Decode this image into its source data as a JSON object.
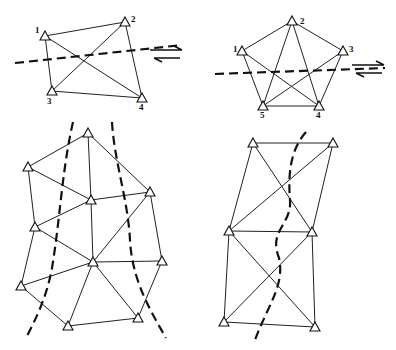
{
  "diagrams": [
    {
      "id": "quadrilateral",
      "stations": [
        {
          "label": "1",
          "x": 45,
          "y": 36,
          "lx": 35,
          "ly": 33
        },
        {
          "label": "2",
          "x": 125,
          "y": 22,
          "lx": 131,
          "ly": 22
        },
        {
          "label": "3",
          "x": 52,
          "y": 91,
          "lx": 47,
          "ly": 104
        },
        {
          "label": "4",
          "x": 142,
          "y": 98,
          "lx": 139,
          "ly": 110
        }
      ],
      "edges": [
        [
          0,
          1
        ],
        [
          0,
          2
        ],
        [
          0,
          3
        ],
        [
          1,
          2
        ],
        [
          1,
          3
        ],
        [
          2,
          3
        ]
      ],
      "fault": "M15 63 L182 45",
      "shear_sense": "right-lateral",
      "arrow_origin": {
        "x": 150,
        "y": 46
      }
    },
    {
      "id": "pentagon",
      "stations": [
        {
          "label": "1",
          "x": 242,
          "y": 51,
          "lx": 233,
          "ly": 52
        },
        {
          "label": "2",
          "x": 292,
          "y": 21,
          "lx": 300,
          "ly": 24
        },
        {
          "label": "3",
          "x": 343,
          "y": 51,
          "lx": 349,
          "ly": 52
        },
        {
          "label": "4",
          "x": 319,
          "y": 106,
          "lx": 316,
          "ly": 118
        },
        {
          "label": "5",
          "x": 263,
          "y": 106,
          "lx": 260,
          "ly": 118
        }
      ],
      "edges": [
        [
          0,
          1
        ],
        [
          1,
          2
        ],
        [
          2,
          3
        ],
        [
          3,
          4
        ],
        [
          4,
          0
        ],
        [
          0,
          3
        ],
        [
          1,
          3
        ],
        [
          1,
          4
        ],
        [
          2,
          4
        ]
      ],
      "fault": "M215 74 L385 68",
      "shear_sense": "right-lateral",
      "arrow_origin": {
        "x": 352,
        "y": 61
      }
    },
    {
      "id": "triangulation-network",
      "stations": [
        {
          "label": "",
          "x": 88,
          "y": 133
        },
        {
          "label": "",
          "x": 28,
          "y": 167
        },
        {
          "label": "",
          "x": 91,
          "y": 200
        },
        {
          "label": "",
          "x": 150,
          "y": 192
        },
        {
          "label": "",
          "x": 35,
          "y": 227
        },
        {
          "label": "",
          "x": 93,
          "y": 262
        },
        {
          "label": "",
          "x": 162,
          "y": 261
        },
        {
          "label": "",
          "x": 21,
          "y": 286
        },
        {
          "label": "",
          "x": 68,
          "y": 326
        },
        {
          "label": "",
          "x": 138,
          "y": 318
        }
      ],
      "edges": [
        [
          0,
          1
        ],
        [
          0,
          2
        ],
        [
          0,
          3
        ],
        [
          1,
          2
        ],
        [
          1,
          4
        ],
        [
          2,
          3
        ],
        [
          2,
          5
        ],
        [
          3,
          5
        ],
        [
          3,
          6
        ],
        [
          4,
          2
        ],
        [
          4,
          5
        ],
        [
          5,
          6
        ],
        [
          4,
          7
        ],
        [
          5,
          7
        ],
        [
          7,
          8
        ],
        [
          5,
          8
        ],
        [
          5,
          9
        ],
        [
          8,
          9
        ],
        [
          6,
          9
        ]
      ],
      "faults": [
        "M73 122 C 62 170, 60 220, 52 268 C 46 300, 35 320, 26 338",
        "M112 122 C 114 160, 128 200, 130 240 C 132 280, 150 310, 166 338"
      ]
    },
    {
      "id": "braced-quadrilaterals",
      "stations": [
        {
          "label": "",
          "x": 253,
          "y": 143
        },
        {
          "label": "",
          "x": 333,
          "y": 143
        },
        {
          "label": "",
          "x": 229,
          "y": 231
        },
        {
          "label": "",
          "x": 312,
          "y": 232
        },
        {
          "label": "",
          "x": 224,
          "y": 322
        },
        {
          "label": "",
          "x": 315,
          "y": 327
        }
      ],
      "edges": [
        [
          0,
          1
        ],
        [
          0,
          2
        ],
        [
          0,
          3
        ],
        [
          1,
          2
        ],
        [
          1,
          3
        ],
        [
          2,
          3
        ],
        [
          2,
          4
        ],
        [
          2,
          5
        ],
        [
          3,
          4
        ],
        [
          3,
          5
        ],
        [
          4,
          5
        ]
      ],
      "faults": [
        "M306 132 C 290 150, 288 175, 290 200 C 292 225, 268 230, 279 258 C 285 285, 268 305, 255 340"
      ]
    }
  ]
}
